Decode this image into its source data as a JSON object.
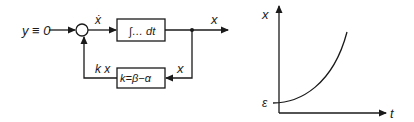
{
  "block_diagram": {
    "input_label": "y ≡ 0",
    "sum_output_label": "ẋ",
    "integrator_label": "∫… dt",
    "output_label": "x",
    "feedback_in_label": "x",
    "feedback_gain_label": "k=β−α",
    "feedback_out_label": "k x"
  },
  "plot": {
    "y_axis_label": "x",
    "x_axis_label": "t",
    "initial_value_label": "ε",
    "curve": "exponential growth starting at ε"
  },
  "colors": {
    "line": "#1a1a1a",
    "background": "#ffffff"
  }
}
